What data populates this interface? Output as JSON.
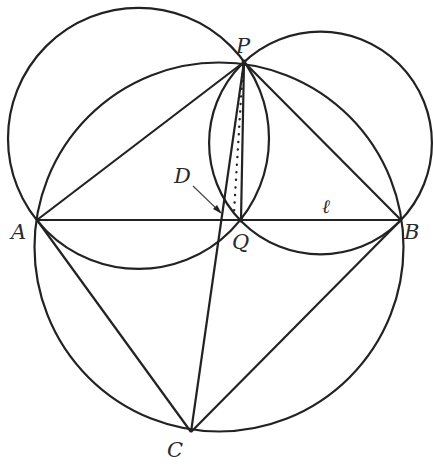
{
  "diagram": {
    "stroke_color": "#222222",
    "points": {
      "P": {
        "label": "P",
        "x": 244,
        "y": 62
      },
      "A": {
        "label": "A",
        "x": 37,
        "y": 220
      },
      "B": {
        "label": "B",
        "x": 401,
        "y": 220
      },
      "Q": {
        "label": "Q",
        "x": 241,
        "y": 220
      },
      "C": {
        "label": "C",
        "x": 191,
        "y": 432
      },
      "D": {
        "label": "D",
        "x": 222,
        "y": 213
      }
    },
    "line_label": "ℓ",
    "circles": [
      {
        "name": "circle-APQ",
        "cx": 138.5,
        "cy": 138.4,
        "r": 130.5
      },
      {
        "name": "circle-PQB",
        "cx": 320.5,
        "cy": 143,
        "r": 111.4
      },
      {
        "name": "circle-APBC",
        "cx": 219,
        "cy": 247,
        "r": 184.5
      }
    ]
  }
}
